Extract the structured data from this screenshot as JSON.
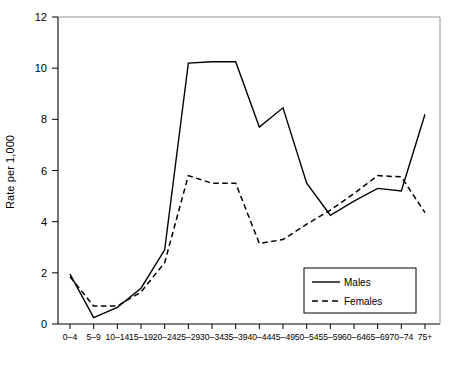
{
  "chart_data": {
    "type": "line",
    "title": "",
    "xlabel": "",
    "ylabel": "Rate per 1,000",
    "ylim": [
      0,
      12
    ],
    "ytick_values": [
      0,
      2,
      4,
      6,
      8,
      10,
      12
    ],
    "ytick_labels": [
      "0",
      "2",
      "4",
      "6",
      "8",
      "10",
      "12"
    ],
    "grid": false,
    "legend_position": "bottom-right",
    "categories": [
      "0–4",
      "5–9",
      "10–14",
      "15–19",
      "20–24",
      "25–29",
      "30–34",
      "35–39",
      "40–44",
      "45–49",
      "50–54",
      "55–59",
      "60–64",
      "65–69",
      "70–74",
      "75+"
    ],
    "series": [
      {
        "name": "Males",
        "style": "solid",
        "color": "#000000",
        "values": [
          1.95,
          0.25,
          0.65,
          1.4,
          2.9,
          10.2,
          10.25,
          10.25,
          7.7,
          8.45,
          5.5,
          4.25,
          4.8,
          5.3,
          5.2,
          8.2
        ]
      },
      {
        "name": "Females",
        "style": "dashed",
        "color": "#000000",
        "values": [
          1.85,
          0.7,
          0.7,
          1.25,
          2.4,
          5.8,
          5.5,
          5.5,
          3.15,
          3.3,
          3.9,
          4.45,
          5.1,
          5.8,
          5.75,
          4.35
        ]
      }
    ]
  },
  "legend": {
    "items": [
      {
        "label": "Males",
        "style": "solid"
      },
      {
        "label": "Females",
        "style": "dashed"
      }
    ]
  },
  "axes": {
    "y_axis_label": "Rate per 1,000"
  }
}
